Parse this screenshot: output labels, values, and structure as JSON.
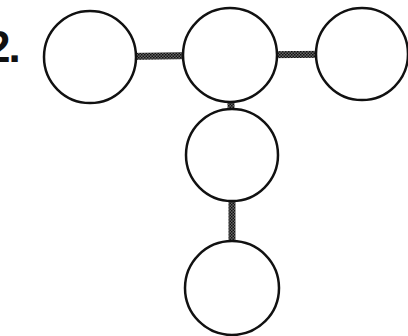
{
  "problem": {
    "number_label": "2."
  },
  "diagram": {
    "nodes": [
      {
        "id": "top-left",
        "cx": 90,
        "cy": 57,
        "r": 46
      },
      {
        "id": "top-center",
        "cx": 230,
        "cy": 55,
        "r": 47
      },
      {
        "id": "top-right",
        "cx": 362,
        "cy": 54,
        "r": 46
      },
      {
        "id": "middle",
        "cx": 232,
        "cy": 155,
        "r": 46
      },
      {
        "id": "bottom",
        "cx": 232,
        "cy": 288,
        "r": 47
      }
    ],
    "edges": [
      {
        "from": "top-left",
        "to": "top-center"
      },
      {
        "from": "top-center",
        "to": "top-right"
      },
      {
        "from": "top-center",
        "to": "middle"
      },
      {
        "from": "middle",
        "to": "bottom"
      }
    ],
    "colors": {
      "stroke": "#111111",
      "connector": "#444444",
      "fill": "#ffffff"
    }
  }
}
